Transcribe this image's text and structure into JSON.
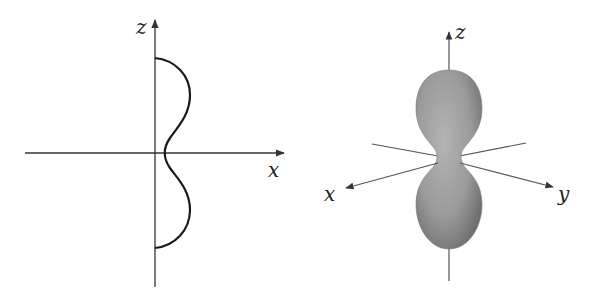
{
  "left_panel": {
    "title": "2D cross-section (xz-plane)",
    "axes": {
      "horizontal": "x",
      "vertical": "z"
    }
  },
  "right_panel": {
    "title": "3D surface of revolution",
    "axes": {
      "x": "x",
      "y": "y",
      "z": "z"
    }
  },
  "colors": {
    "curve": "#1a1a1a",
    "axis": "#333333",
    "surface": "#9a9a9a",
    "surface_dark": "#6e6e6e"
  }
}
